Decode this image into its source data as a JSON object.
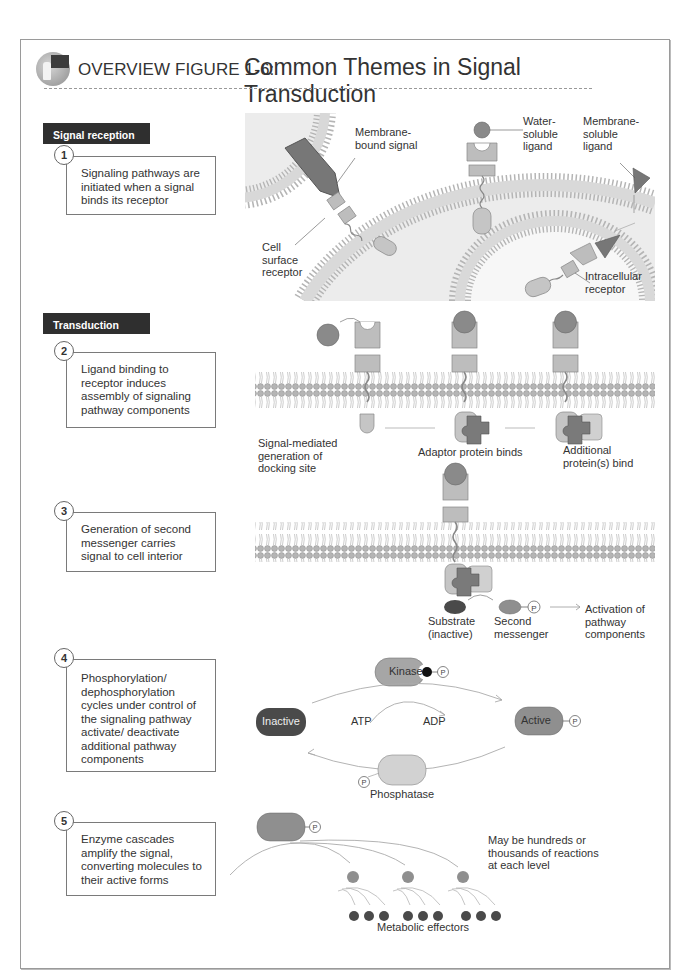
{
  "figure": {
    "title_prefix": "OVERVIEW FIGURE 1-6:",
    "title": "Common Themes in Signal Transduction",
    "logo_icon": "teacher-at-board-icon"
  },
  "sections": [
    {
      "label": "Signal reception"
    },
    {
      "label": "Transduction"
    }
  ],
  "steps": [
    {
      "number": "1",
      "text": "Signaling pathways are initiated when a signal binds its receptor"
    },
    {
      "number": "2",
      "text": "Ligand binding to receptor induces assembly of signaling pathway components"
    },
    {
      "number": "3",
      "text": "Generation of second messenger carries signal to cell interior"
    },
    {
      "number": "4",
      "text": "Phosphorylation/ dephosphorylation cycles under control of the signaling pathway activate/ deactivate additional pathway components"
    },
    {
      "number": "5",
      "text": "Enzyme cascades amplify the signal, converting molecules to their active forms"
    }
  ],
  "panel1": {
    "membrane_bound_signal": "Membrane-\nbound signal",
    "cell_surface_receptor": "Cell\nsurface\nreceptor",
    "water_soluble_ligand": "Water-\nsoluble\nligand",
    "membrane_soluble_ligand": "Membrane-\nsoluble\nligand",
    "intracellular_receptor": "Intracellular\nreceptor"
  },
  "panel2": {
    "docking_site": "Signal-mediated\ngeneration of\ndocking site",
    "adaptor": "Adaptor protein binds",
    "additional": "Additional\nprotein(s) bind"
  },
  "panel3": {
    "substrate": "Substrate\n(inactive)",
    "second_messenger": "Second\nmessenger",
    "activation": "Activation of\npathway\ncomponents",
    "phosphate_symbol": "P"
  },
  "panel4": {
    "kinase": "Kinase",
    "inactive": "Inactive",
    "active": "Active",
    "atp": "ATP",
    "adp": "ADP",
    "phosphatase": "Phosphatase",
    "phosphate_symbol": "P"
  },
  "panel5": {
    "note": "May be hundreds or\nthousands of reactions\nat each level",
    "effectors": "Metabolic effectors",
    "phosphate_symbol": "P"
  },
  "colors": {
    "section_bar": "#2f2f2f",
    "ligand": "#8a8a8a",
    "receptor": "#bdbdbd",
    "lipid_head": "#b5b5b5",
    "cell_interior": "#ececec",
    "inactive": "#4a4a4a",
    "active": "#8f8f8f",
    "kinase": "#a6a6a6",
    "phosphatase": "#d2d2d2",
    "adaptor": "#7a7a7a"
  }
}
